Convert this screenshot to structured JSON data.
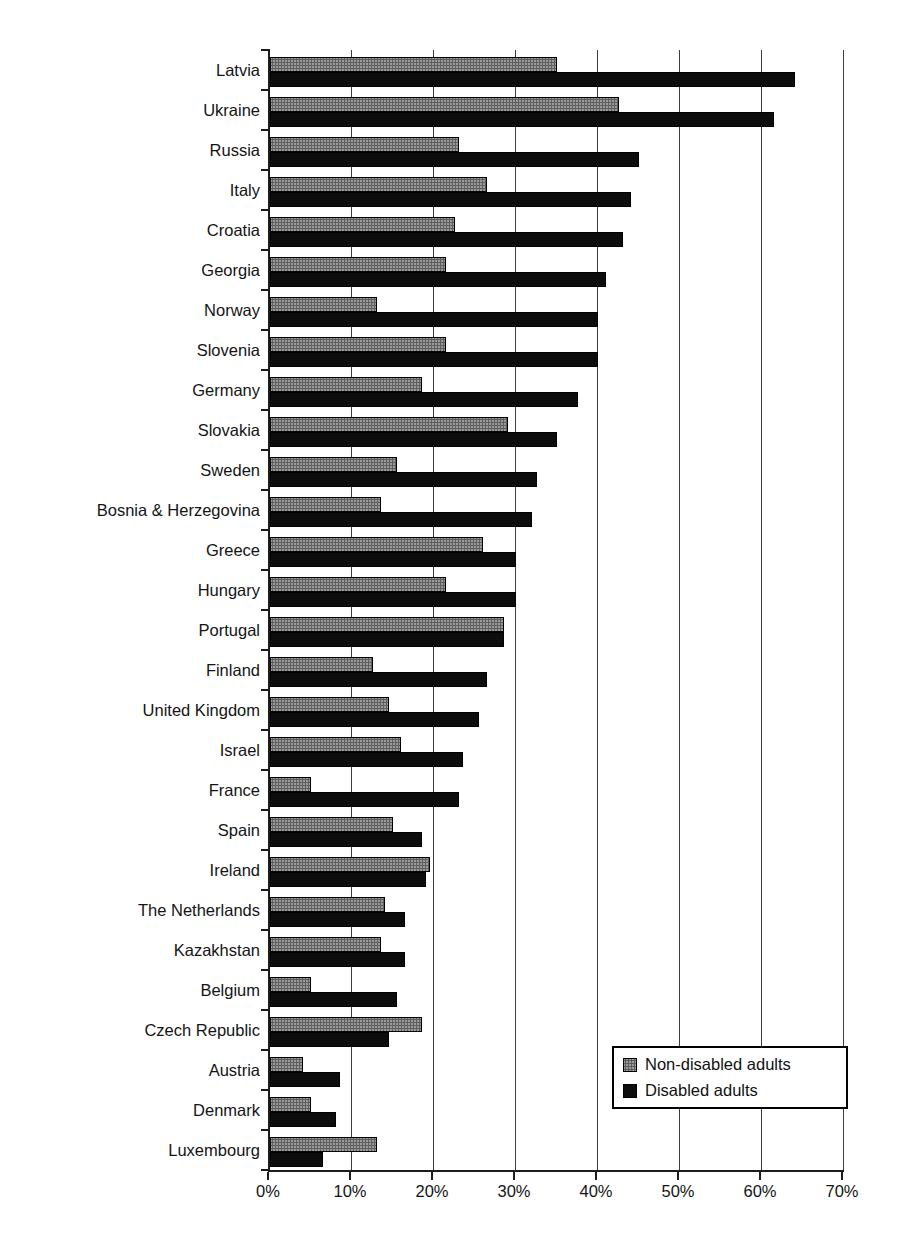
{
  "chart_data": {
    "type": "bar",
    "orientation": "horizontal",
    "title": "",
    "xlabel": "",
    "ylabel": "",
    "grid": true,
    "x_axis": {
      "min": 0,
      "max": 70,
      "step": 10,
      "unit": "%",
      "tick_labels": [
        "0%",
        "10%",
        "20%",
        "30%",
        "40%",
        "50%",
        "60%",
        "70%"
      ]
    },
    "legend": {
      "position": "inside-bottom-right",
      "entries": [
        "Non-disabled adults",
        "Disabled adults"
      ]
    },
    "categories": [
      "Latvia",
      "Ukraine",
      "Russia",
      "Italy",
      "Croatia",
      "Georgia",
      "Norway",
      "Slovenia",
      "Germany",
      "Slovakia",
      "Sweden",
      "Bosnia & Herzegovina",
      "Greece",
      "Hungary",
      "Portugal",
      "Finland",
      "United Kingdom",
      "Israel",
      "France",
      "Spain",
      "Ireland",
      "The Netherlands",
      "Kazakhstan",
      "Belgium",
      "Czech Republic",
      "Austria",
      "Denmark",
      "Luxembourg"
    ],
    "series": [
      {
        "name": "Non-disabled adults",
        "color": "#9b9b9b",
        "values": [
          35,
          42.5,
          23,
          26.5,
          22.5,
          21.5,
          13,
          21.5,
          18.5,
          29,
          15.5,
          13.5,
          26,
          21.5,
          28.5,
          12.5,
          14.5,
          16,
          5,
          15,
          19.5,
          14,
          13.5,
          5,
          18.5,
          4,
          5,
          13
        ]
      },
      {
        "name": "Disabled adults",
        "color": "#0d0d0d",
        "values": [
          64,
          61.5,
          45,
          44,
          43,
          41,
          40,
          40,
          37.5,
          35,
          32.5,
          32,
          30,
          30,
          28.5,
          26.5,
          25.5,
          23.5,
          23,
          18.5,
          19,
          16.5,
          16.5,
          15.5,
          14.5,
          8.5,
          8,
          6.5
        ]
      }
    ]
  }
}
